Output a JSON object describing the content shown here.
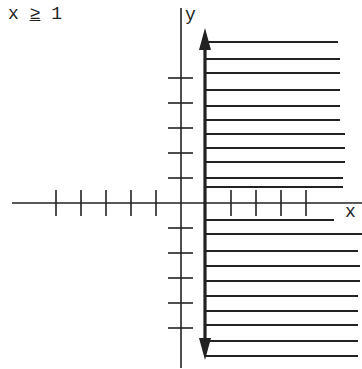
{
  "title": {
    "lhs": "x",
    "op": "≥",
    "rhs": "1"
  },
  "axes": {
    "x_label": "x",
    "y_label": "y",
    "origin_px": [
      181,
      203
    ],
    "unit_px": 25,
    "x_axis_px": [
      12,
      362
    ],
    "y_axis_px": [
      8,
      368
    ],
    "x_ticks": [
      -5,
      -4,
      -3,
      -2,
      -1,
      2,
      3,
      4,
      5
    ],
    "y_ticks": [
      -5,
      -4,
      -3,
      -2,
      -1,
      1,
      2,
      3,
      4,
      5
    ]
  },
  "boundary": {
    "x": 1,
    "x_px": 205,
    "top_px": 28,
    "bottom_px": 360,
    "style": "solid-bold",
    "arrows": "both"
  },
  "shading": {
    "direction": "right",
    "line_ys": [
      42,
      59,
      73,
      90,
      106,
      120,
      134,
      148,
      162,
      178,
      187,
      220,
      234,
      251,
      266,
      281,
      296,
      311,
      325,
      341,
      356
    ],
    "line_ends": [
      338,
      340,
      340,
      340,
      340,
      340,
      345,
      345,
      345,
      343,
      343,
      334,
      362,
      358,
      360,
      360,
      358,
      358,
      358,
      358,
      358
    ]
  },
  "colors": {
    "ink": "#222222",
    "background": "#ffffff"
  }
}
